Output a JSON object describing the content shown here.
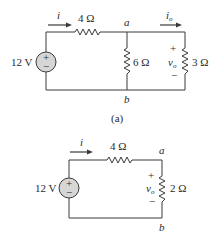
{
  "figure": {
    "circuits": [
      {
        "id": "a",
        "caption": "(a)",
        "source": {
          "label": "12 V",
          "plus": "+",
          "minus": "−"
        },
        "current_label": "i",
        "series_resistor": "4 Ω",
        "node_top": "a",
        "node_bottom": "b",
        "middle_resistor": "6 Ω",
        "right_current_label": "i",
        "right_current_sub": "o",
        "right_voltage": {
          "label": "v",
          "sub": "o",
          "plus": "+",
          "minus": "−"
        },
        "right_resistor": "3 Ω"
      },
      {
        "id": "b",
        "caption": "(b)",
        "source": {
          "label": "12 V",
          "plus": "+",
          "minus": "−"
        },
        "current_label": "i",
        "series_resistor": "4 Ω",
        "node_top": "a",
        "node_bottom": "b",
        "right_voltage": {
          "label": "v",
          "sub": "o",
          "plus": "+",
          "minus": "−"
        },
        "right_resistor": "2 Ω"
      }
    ]
  }
}
